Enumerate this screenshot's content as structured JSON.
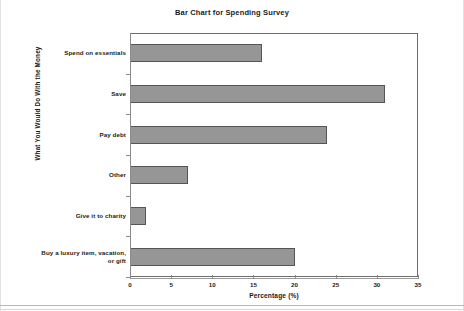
{
  "chart_data": {
    "type": "bar",
    "orientation": "horizontal",
    "title": "Bar Chart for Spending Survey",
    "xlabel": "Percentage (%)",
    "ylabel": "What You Would Do With the Money",
    "categories": [
      "Spend on essentials",
      "Save",
      "Pay debt",
      "Other",
      "Give it to charity",
      "Buy a luxury item, vacation, or gift"
    ],
    "category_lines": [
      [
        "Spend on essentials"
      ],
      [
        "Save"
      ],
      [
        "Pay debt"
      ],
      [
        "Other"
      ],
      [
        "Give it to charity"
      ],
      [
        "Buy a luxury item, vacation,",
        "or gift"
      ]
    ],
    "values": [
      16,
      31,
      24,
      7,
      2,
      20
    ],
    "xlim": [
      0,
      35
    ],
    "xticks": [
      0,
      5,
      10,
      15,
      20,
      25,
      30,
      35
    ],
    "xtick_labels": [
      "0",
      "5",
      "10",
      "15",
      "20",
      "25",
      "30",
      "35"
    ],
    "grid": false,
    "legend": false,
    "bar_color": "#969696",
    "bar_border_color": "#555555",
    "axis_color": "#6e6e6e",
    "text_color": "#1a1a1a",
    "background": "#ffffff"
  }
}
